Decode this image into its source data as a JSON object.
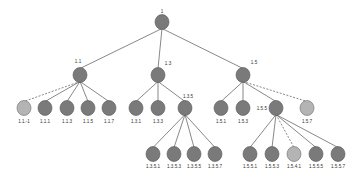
{
  "diagram": {
    "type": "tree",
    "colors": {
      "node_fill": "#7a7a7a",
      "node_light_fill": "#b4b4b4",
      "edge": "#6a6a6a",
      "label": "#333333"
    },
    "nodes": [
      {
        "id": "1",
        "label": "1",
        "x": 162,
        "y": 22,
        "style": "normal",
        "lx": 162,
        "ly": 13,
        "anchor": "middle"
      },
      {
        "id": "1.1",
        "label": "1.1",
        "x": 80,
        "y": 75,
        "style": "normal",
        "lx": 78,
        "ly": 63,
        "anchor": "middle"
      },
      {
        "id": "1.3",
        "label": "1.3",
        "x": 158,
        "y": 75,
        "style": "normal",
        "lx": 168,
        "ly": 65,
        "anchor": "middle"
      },
      {
        "id": "1.5",
        "label": "1.5",
        "x": 243,
        "y": 75,
        "style": "normal",
        "lx": 254,
        "ly": 64,
        "anchor": "middle"
      },
      {
        "id": "1.1.-1",
        "label": "1.1.-1",
        "x": 24,
        "y": 108,
        "style": "light",
        "lx": 24,
        "ly": 123,
        "anchor": "middle"
      },
      {
        "id": "1.1.1",
        "label": "1.1.1",
        "x": 45,
        "y": 108,
        "style": "normal",
        "lx": 45,
        "ly": 123,
        "anchor": "middle"
      },
      {
        "id": "1.1.3",
        "label": "1.1.3",
        "x": 67,
        "y": 108,
        "style": "normal",
        "lx": 67,
        "ly": 123,
        "anchor": "middle"
      },
      {
        "id": "1.1.5",
        "label": "1.1.5",
        "x": 88,
        "y": 108,
        "style": "normal",
        "lx": 88,
        "ly": 123,
        "anchor": "middle"
      },
      {
        "id": "1.1.7",
        "label": "1.1.7",
        "x": 109,
        "y": 108,
        "style": "normal",
        "lx": 109,
        "ly": 123,
        "anchor": "middle"
      },
      {
        "id": "1.3.1",
        "label": "1.3.1",
        "x": 136,
        "y": 108,
        "style": "normal",
        "lx": 136,
        "ly": 123,
        "anchor": "middle"
      },
      {
        "id": "1.3.3",
        "label": "1.3.3",
        "x": 158,
        "y": 108,
        "style": "normal",
        "lx": 158,
        "ly": 123,
        "anchor": "middle"
      },
      {
        "id": "1.3.5",
        "label": "1.3.5",
        "x": 185,
        "y": 108,
        "style": "normal",
        "lx": 188,
        "ly": 98,
        "anchor": "middle"
      },
      {
        "id": "1.5.1",
        "label": "1.5.1",
        "x": 221,
        "y": 108,
        "style": "normal",
        "lx": 221,
        "ly": 123,
        "anchor": "middle"
      },
      {
        "id": "1.5.3",
        "label": "1.5.3",
        "x": 243,
        "y": 108,
        "style": "normal",
        "lx": 243,
        "ly": 123,
        "anchor": "middle"
      },
      {
        "id": "1.5.5",
        "label": "1.5.5",
        "x": 276,
        "y": 108,
        "style": "normal",
        "lx": 267,
        "ly": 110,
        "anchor": "end"
      },
      {
        "id": "1.5.7",
        "label": "1.5.7",
        "x": 307,
        "y": 108,
        "style": "light",
        "lx": 307,
        "ly": 123,
        "anchor": "middle"
      },
      {
        "id": "1.3.5.1",
        "label": "1.3.5.1",
        "x": 153,
        "y": 154,
        "style": "normal",
        "lx": 153,
        "ly": 168,
        "anchor": "middle"
      },
      {
        "id": "1.3.5.3",
        "label": "1.3.5.3",
        "x": 174,
        "y": 154,
        "style": "normal",
        "lx": 174,
        "ly": 168,
        "anchor": "middle"
      },
      {
        "id": "1.3.5.5",
        "label": "1.3.5.5",
        "x": 194,
        "y": 154,
        "style": "normal",
        "lx": 194,
        "ly": 168,
        "anchor": "middle"
      },
      {
        "id": "1.3.5.7",
        "label": "1.3.5.7",
        "x": 215,
        "y": 154,
        "style": "normal",
        "lx": 215,
        "ly": 168,
        "anchor": "middle"
      },
      {
        "id": "1.5.5.1",
        "label": "1.5.5.1",
        "x": 250,
        "y": 154,
        "style": "normal",
        "lx": 250,
        "ly": 168,
        "anchor": "middle"
      },
      {
        "id": "1.5.5.3",
        "label": "1.5.5.3",
        "x": 272,
        "y": 154,
        "style": "normal",
        "lx": 272,
        "ly": 168,
        "anchor": "middle"
      },
      {
        "id": "1.5.4.1",
        "label": "1.5.4.1",
        "x": 294,
        "y": 154,
        "style": "light",
        "lx": 294,
        "ly": 168,
        "anchor": "middle"
      },
      {
        "id": "1.5.5.5",
        "label": "1.5.5.5",
        "x": 316,
        "y": 154,
        "style": "normal",
        "lx": 316,
        "ly": 168,
        "anchor": "middle"
      },
      {
        "id": "1.5.5.7",
        "label": "1.5.5.7",
        "x": 338,
        "y": 154,
        "style": "normal",
        "lx": 338,
        "ly": 168,
        "anchor": "middle"
      }
    ],
    "edges": [
      {
        "from": "1",
        "to": "1.1",
        "dashed": false
      },
      {
        "from": "1",
        "to": "1.3",
        "dashed": false
      },
      {
        "from": "1",
        "to": "1.5",
        "dashed": false
      },
      {
        "from": "1.1",
        "to": "1.1.-1",
        "dashed": true
      },
      {
        "from": "1.1",
        "to": "1.1.1",
        "dashed": false
      },
      {
        "from": "1.1",
        "to": "1.1.3",
        "dashed": false
      },
      {
        "from": "1.1",
        "to": "1.1.5",
        "dashed": false
      },
      {
        "from": "1.1",
        "to": "1.1.7",
        "dashed": false
      },
      {
        "from": "1.3",
        "to": "1.3.1",
        "dashed": false
      },
      {
        "from": "1.3",
        "to": "1.3.3",
        "dashed": false
      },
      {
        "from": "1.3",
        "to": "1.3.5",
        "dashed": false
      },
      {
        "from": "1.5",
        "to": "1.5.1",
        "dashed": false
      },
      {
        "from": "1.5",
        "to": "1.5.3",
        "dashed": false
      },
      {
        "from": "1.5",
        "to": "1.5.5",
        "dashed": false
      },
      {
        "from": "1.5",
        "to": "1.5.7",
        "dashed": true
      },
      {
        "from": "1.3.5",
        "to": "1.3.5.1",
        "dashed": false
      },
      {
        "from": "1.3.5",
        "to": "1.3.5.3",
        "dashed": false
      },
      {
        "from": "1.3.5",
        "to": "1.3.5.5",
        "dashed": false
      },
      {
        "from": "1.3.5",
        "to": "1.3.5.7",
        "dashed": false
      },
      {
        "from": "1.5.5",
        "to": "1.5.5.1",
        "dashed": false
      },
      {
        "from": "1.5.5",
        "to": "1.5.5.3",
        "dashed": false
      },
      {
        "from": "1.5.5",
        "to": "1.5.4.1",
        "dashed": true
      },
      {
        "from": "1.5.5",
        "to": "1.5.5.5",
        "dashed": false
      },
      {
        "from": "1.5.5",
        "to": "1.5.5.7",
        "dashed": false
      }
    ],
    "node_radius_x": 7,
    "node_radius_y": 7.5
  }
}
